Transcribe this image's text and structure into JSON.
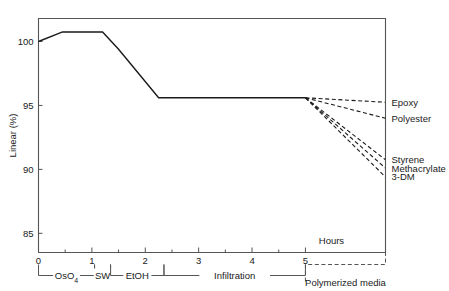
{
  "chart_data": {
    "type": "line",
    "title": "",
    "xlabel": "Hours",
    "ylabel": "Linear (%)",
    "xlim": [
      0,
      6.5
    ],
    "ylim": [
      83.5,
      101.8
    ],
    "xticks": [
      0,
      1,
      2,
      3,
      4,
      5
    ],
    "xtick_labels": [
      "0",
      "1",
      "2",
      "3",
      "4",
      "5"
    ],
    "xminor_ticks": [
      0.5,
      1.5,
      2.5,
      3.5,
      4.5
    ],
    "yticks": [
      85,
      90,
      95,
      100
    ],
    "ytick_labels": [
      "85",
      "90",
      "95",
      "100"
    ],
    "grid": false,
    "legend_position": "right-of-axes",
    "main_series": {
      "name": "Specimen linear dimension",
      "style": "solid",
      "points": [
        {
          "x": 0.0,
          "y": 100.0
        },
        {
          "x": 0.45,
          "y": 100.75
        },
        {
          "x": 1.2,
          "y": 100.75
        },
        {
          "x": 1.5,
          "y": 99.4
        },
        {
          "x": 2.25,
          "y": 95.6
        },
        {
          "x": 5.0,
          "y": 95.6
        }
      ]
    },
    "branches": [
      {
        "name": "Epoxy",
        "style": "dashed",
        "from": {
          "x": 5.0,
          "y": 95.6
        },
        "to": {
          "x": 6.5,
          "y": 95.25
        }
      },
      {
        "name": "Polyester",
        "style": "dashed",
        "from": {
          "x": 5.0,
          "y": 95.6
        },
        "to": {
          "x": 6.5,
          "y": 94.0
        }
      },
      {
        "name": "Styrene",
        "style": "dashed",
        "from": {
          "x": 5.0,
          "y": 95.6
        },
        "to": {
          "x": 6.5,
          "y": 90.75
        }
      },
      {
        "name": "Methacrylate",
        "style": "dashed",
        "from": {
          "x": 5.0,
          "y": 95.6
        },
        "to": {
          "x": 6.5,
          "y": 90.1
        }
      },
      {
        "name": "3-DM",
        "style": "dashed",
        "from": {
          "x": 5.0,
          "y": 95.6
        },
        "to": {
          "x": 6.5,
          "y": 89.4
        }
      }
    ],
    "regions": [
      {
        "label": "OsO4",
        "label_display": "OsO",
        "subscript": "4",
        "from": 0.0,
        "to": 1.05,
        "style": "solid"
      },
      {
        "label": "SW",
        "label_display": "SW",
        "subscript": "",
        "from": 1.05,
        "to": 1.35,
        "style": "solid"
      },
      {
        "label": "EtOH",
        "label_display": "EtOH",
        "subscript": "",
        "from": 1.35,
        "to": 2.35,
        "style": "solid"
      },
      {
        "label": "Infiltration",
        "label_display": "Infiltration",
        "subscript": "",
        "from": 2.35,
        "to": 5.0,
        "style": "solid"
      },
      {
        "label": "Polymerized media",
        "label_display": "Polymerized  media",
        "subscript": "",
        "from": 5.0,
        "to": 6.5,
        "style": "dashed"
      }
    ],
    "annotations": [
      {
        "text": "Hours",
        "x": 5.25,
        "y": 84.2
      }
    ],
    "colors": {
      "line": "#1a1a1a",
      "axis": "#555555",
      "text": "#1a1a1a",
      "background": "#ffffff"
    }
  }
}
